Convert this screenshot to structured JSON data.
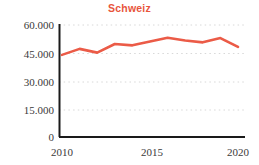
{
  "chart_data": {
    "type": "line",
    "title": "Schweiz",
    "xlabel": "",
    "ylabel": "",
    "x": [
      2010,
      2011,
      2012,
      2013,
      2014,
      2015,
      2016,
      2017,
      2018,
      2019,
      2020
    ],
    "values": [
      44000,
      47200,
      45200,
      49800,
      49100,
      51200,
      53200,
      51700,
      50700,
      53000,
      48300
    ],
    "series": [
      {
        "name": "Schweiz",
        "values": [
          44000,
          47200,
          45200,
          49800,
          49100,
          51200,
          53200,
          51700,
          50700,
          53000,
          48300
        ]
      }
    ],
    "ylim": [
      0,
      60000
    ],
    "xlim": [
      2010,
      2020
    ],
    "yticks": [
      0,
      15000,
      30000,
      45000,
      60000
    ],
    "ytick_labels": [
      "0",
      "15.000",
      "30.000",
      "45.000",
      "60.000"
    ],
    "xticks": [
      2010,
      2015,
      2020
    ],
    "xtick_labels": [
      "2010",
      "2015",
      "2020"
    ],
    "grid": "horizontal-dotted",
    "legend": "none",
    "line_color": "#eb5b47",
    "title_color": "#e8553c",
    "axis_color": "#1a1a1a",
    "grid_color": "#d8d8d8"
  }
}
